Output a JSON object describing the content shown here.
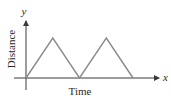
{
  "chart_data": {
    "type": "line",
    "title": "",
    "xlabel": "Time",
    "ylabel": "Distance",
    "x_axis_symbol": "x",
    "y_axis_symbol": "y",
    "x": [
      0,
      1,
      2,
      3,
      4
    ],
    "series": [
      {
        "name": "distance",
        "values": [
          0,
          1,
          0,
          1,
          0
        ]
      }
    ],
    "grid": false,
    "legend": null,
    "ticks": "none",
    "colors": {
      "line": "#8a8a8a",
      "axis": "#3a3a3a"
    }
  },
  "labels": {
    "x_axis": "Time",
    "y_axis": "Distance",
    "x_symbol": "x",
    "y_symbol": "y"
  }
}
